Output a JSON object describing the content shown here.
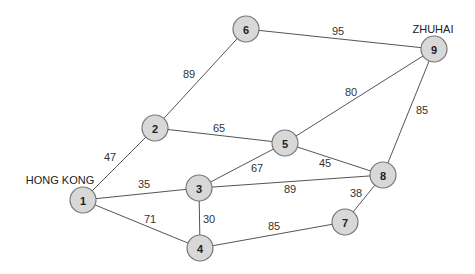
{
  "diagram": {
    "type": "weighted-undirected-graph",
    "nodes": [
      {
        "id": "1",
        "x": 83,
        "y": 200
      },
      {
        "id": "2",
        "x": 155,
        "y": 128
      },
      {
        "id": "3",
        "x": 199,
        "y": 188
      },
      {
        "id": "4",
        "x": 200,
        "y": 248
      },
      {
        "id": "5",
        "x": 285,
        "y": 143
      },
      {
        "id": "6",
        "x": 246,
        "y": 29
      },
      {
        "id": "7",
        "x": 345,
        "y": 222
      },
      {
        "id": "8",
        "x": 383,
        "y": 175
      },
      {
        "id": "9",
        "x": 434,
        "y": 49
      }
    ],
    "edges": [
      {
        "from": "1",
        "to": "2",
        "weight": "47",
        "lx": 110,
        "ly": 157
      },
      {
        "from": "1",
        "to": "3",
        "weight": "35",
        "lx": 144,
        "ly": 184
      },
      {
        "from": "1",
        "to": "4",
        "weight": "71",
        "lx": 150,
        "ly": 219
      },
      {
        "from": "2",
        "to": "6",
        "weight": "89",
        "lx": 189,
        "ly": 74
      },
      {
        "from": "2",
        "to": "5",
        "weight": "65",
        "lx": 219,
        "ly": 128
      },
      {
        "from": "3",
        "to": "4",
        "weight": "30",
        "lx": 209,
        "ly": 219
      },
      {
        "from": "3",
        "to": "5",
        "weight": "67",
        "lx": 257,
        "ly": 168
      },
      {
        "from": "3",
        "to": "8",
        "weight": "89",
        "lx": 290,
        "ly": 189
      },
      {
        "from": "4",
        "to": "7",
        "weight": "85",
        "lx": 274,
        "ly": 226
      },
      {
        "from": "5",
        "to": "8",
        "weight": "45",
        "lx": 325,
        "ly": 163
      },
      {
        "from": "5",
        "to": "9",
        "weight": "80",
        "lx": 351,
        "ly": 92
      },
      {
        "from": "6",
        "to": "9",
        "weight": "95",
        "lx": 338,
        "ly": 31
      },
      {
        "from": "7",
        "to": "8",
        "weight": "38",
        "lx": 356,
        "ly": 193
      },
      {
        "from": "8",
        "to": "9",
        "weight": "85",
        "lx": 422,
        "ly": 110
      }
    ],
    "city_labels": [
      {
        "node": "1",
        "text": "HONG KONG",
        "x": 60,
        "y": 184
      },
      {
        "node": "9",
        "text": "ZHUHAI",
        "x": 433,
        "y": 33
      }
    ],
    "colors": {
      "node_fill": "#d8d8d8",
      "node_stroke": "#777777",
      "edge": "#555555",
      "text": "#222222"
    }
  }
}
